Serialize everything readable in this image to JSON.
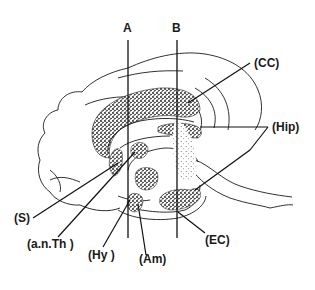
{
  "figure": {
    "type": "sagittal brain section diagram",
    "section_lines": [
      {
        "id": "A",
        "label": "A"
      },
      {
        "id": "B",
        "label": "B"
      }
    ],
    "labels": {
      "cc": "(CC)",
      "hip": "(Hip)",
      "s": "(S)",
      "ant": "(a.n.Th )",
      "hy": "(Hy )",
      "am": "(Am)",
      "ec": "(EC)"
    },
    "colors": {
      "ink": "#1a1a1a",
      "background": "#ffffff"
    }
  }
}
